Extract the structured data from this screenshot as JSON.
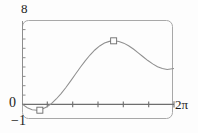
{
  "figure": {
    "kind": "function-plot",
    "frame_color": "#9b9b9b",
    "curve_color": "#8a8a8a",
    "axis_color": "#6e6e6e",
    "marker_color": "#6e6e6e",
    "text_color": "#1c1c1c",
    "background": "#fdfdfd"
  },
  "labels": {
    "y_max": "8",
    "y_origin": "0",
    "y_min": "−1",
    "x_max": "2π"
  },
  "chart_data": {
    "type": "line",
    "title": "",
    "xlabel": "",
    "ylabel": "",
    "xlim": [
      0,
      6.2832
    ],
    "ylim": [
      -1,
      8
    ],
    "xticks": [
      0,
      1.0472,
      2.0944,
      3.1416,
      4.1888,
      5.236,
      6.2832
    ],
    "xticklabels": [
      "0",
      "",
      "",
      "",
      "",
      "",
      "2π"
    ],
    "yticks": [
      -1,
      0,
      1,
      2,
      3,
      4,
      5,
      6,
      7,
      8
    ],
    "yticklabels": [
      "−1",
      "0",
      "",
      "",
      "",
      "",
      "",
      "",
      "",
      "8"
    ],
    "grid": false,
    "legend": null,
    "series": [
      {
        "name": "curve",
        "x": [
          0.0,
          0.2,
          0.4,
          0.6,
          0.8,
          1.0,
          1.2,
          1.4,
          1.6,
          1.8,
          2.0,
          2.2,
          2.4,
          2.6,
          2.8,
          3.0,
          3.2,
          3.4,
          3.6,
          3.8,
          4.0,
          4.2,
          4.4,
          4.6,
          4.8,
          5.0,
          5.2,
          5.4,
          5.6,
          5.8,
          6.0,
          6.2832
        ],
        "y": [
          0.0,
          -0.36,
          -0.57,
          -0.62,
          -0.52,
          -0.28,
          0.09,
          0.58,
          1.16,
          1.81,
          2.52,
          3.25,
          3.97,
          4.66,
          5.28,
          5.82,
          6.25,
          6.56,
          6.74,
          6.8,
          6.73,
          6.55,
          6.27,
          5.92,
          5.52,
          5.1,
          4.69,
          4.33,
          4.03,
          3.83,
          3.74,
          3.83
        ]
      }
    ],
    "markers": [
      {
        "name": "local-minimum",
        "x": 0.72,
        "y": -0.62
      },
      {
        "name": "local-maximum",
        "x": 3.78,
        "y": 6.8
      }
    ]
  }
}
